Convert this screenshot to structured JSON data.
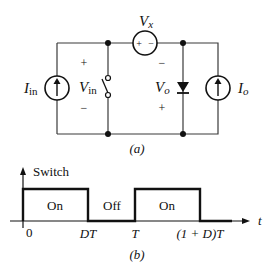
{
  "circuit": {
    "caption": "(a)",
    "sources": {
      "input_current": {
        "symbol": "I",
        "subscript": "in"
      },
      "output_current": {
        "symbol": "I",
        "subscript": "o"
      },
      "series_voltage": {
        "symbol": "V",
        "subscript": "x",
        "plus": "+",
        "minus": "−"
      }
    },
    "voltages": {
      "input_voltage": {
        "symbol": "V",
        "subscript": "in",
        "top_sign": "+",
        "bottom_sign": "−"
      },
      "output_voltage": {
        "symbol": "V",
        "subscript": "o",
        "top_sign": "−",
        "bottom_sign": "+"
      }
    },
    "elements": [
      "current source I_in",
      "switch",
      "voltage source V_x",
      "diode",
      "current source I_o"
    ]
  },
  "timing": {
    "caption": "(b)",
    "y_axis_label": "Switch",
    "x_axis_label": "t",
    "ticks": [
      "0",
      "DT",
      "T",
      "(1 + D)T"
    ],
    "segments": [
      {
        "label": "On",
        "from": "0",
        "to": "DT"
      },
      {
        "label": "Off",
        "from": "DT",
        "to": "T"
      },
      {
        "label": "On",
        "from": "T",
        "to": "(1 + D)T"
      }
    ]
  }
}
